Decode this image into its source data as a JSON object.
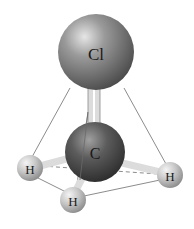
{
  "diagram": {
    "atoms": [
      {
        "id": "cl",
        "label": "Cl",
        "cx": 96,
        "cy": 52,
        "r": 38,
        "fill": "#8a8a8a"
      },
      {
        "id": "c",
        "label": "C",
        "cx": 95,
        "cy": 152,
        "r": 30,
        "fill": "#5a5a5a"
      },
      {
        "id": "h1",
        "label": "H",
        "cx": 30,
        "cy": 168,
        "r": 13,
        "fill": "#c8c8c8"
      },
      {
        "id": "h2",
        "label": "H",
        "cx": 73,
        "cy": 200,
        "r": 13,
        "fill": "#c8c8c8"
      },
      {
        "id": "h3",
        "label": "H",
        "cx": 170,
        "cy": 175,
        "r": 13,
        "fill": "#c8c8c8"
      }
    ],
    "labels": {
      "cl": "Cl",
      "c": "C",
      "h1": "H",
      "h2": "H",
      "h3": "H"
    },
    "colors": {
      "edge": "#8c8c8c",
      "bond": "#e0e0e0",
      "background": "#ffffff"
    }
  }
}
